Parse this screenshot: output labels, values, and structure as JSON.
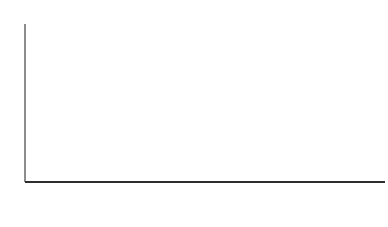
{
  "chart_data": {
    "type": "bar",
    "title": "",
    "subtitle": "",
    "xlabel": "",
    "ylabel": "",
    "ylim": [
      0,
      40
    ],
    "yticks": [
      0,
      10,
      20,
      30,
      40
    ],
    "ytick_labels": [
      "0%",
      "10%",
      "20%",
      "30%",
      "40%"
    ],
    "grid": true,
    "legend_position": "top-right",
    "units": "percent",
    "categories": [
      "<$20K",
      "$20-25K",
      "$26-35K",
      "$36-45K",
      "$46-55K",
      "$56-75K",
      "$76-99K",
      "$100-149K",
      "$150-199K",
      "$200-299K",
      "$300-399K",
      "$400-499K",
      "$500-599K",
      "$600-999K",
      "$1MM-1.5MM",
      "$1.6MM-1.99MM",
      ">$2MM"
    ],
    "series": [
      {
        "name": "Amherst",
        "color": "#6d6d6d",
        "values": [
          5.0,
          5.3,
          3.7,
          6.4,
          5.6,
          8.0,
          12.5,
          15.0,
          15.5,
          23.0,
          13.8,
          14.2,
          4.8,
          2.4,
          1.5,
          2.2,
          0.5
        ]
      },
      {
        "name": "All College Grads",
        "color": "#9e9e9e",
        "values": [
          3.3,
          2.0,
          4.2,
          4.6,
          5.9,
          8.4,
          10.8,
          14.3,
          13.3,
          14.0,
          11.0,
          3.2,
          1.7,
          1.3,
          0.7,
          0.4,
          0.7
        ]
      }
    ]
  },
  "legend": {
    "entries": [
      {
        "label": "Amherst",
        "color": "#6d6d6d"
      },
      {
        "label": "All College Grads",
        "color": "#9e9e9e"
      }
    ]
  },
  "x_axis": {
    "row_top": [
      "<$20K",
      "$26-\n35K",
      "$46-\n55K",
      "$76-\n99K",
      "$150-\n199K",
      "$300-\n399K",
      "$500-\n599K",
      "$1MM-\n1.5MM",
      ">$2MM"
    ],
    "row_bottom": [
      "$20-\n25K",
      "$36-\n45K",
      "$56-\n75K",
      "$100-\n149K",
      "$200-\n299K",
      "$400-\n499K",
      "$600-\n999K",
      "$1.6MM-\n1.99MM"
    ],
    "labels_top": [
      {
        "line1": "<$20K",
        "line2": ""
      },
      {
        "line1": "$26-",
        "line2": "35K"
      },
      {
        "line1": "$46-",
        "line2": "55K"
      },
      {
        "line1": "$76-",
        "line2": "99K"
      },
      {
        "line1": "$150-",
        "line2": "199K"
      },
      {
        "line1": "$300-",
        "line2": "399K"
      },
      {
        "line1": "$500-",
        "line2": "599K"
      },
      {
        "line1": "$1MM-",
        "line2": "1.5MM"
      },
      {
        "line1": ">$2MM",
        "line2": ""
      }
    ],
    "labels_bottom": [
      {
        "line1": "$20-",
        "line2": "25K"
      },
      {
        "line1": "$36-",
        "line2": "45K"
      },
      {
        "line1": "$56-",
        "line2": "75K"
      },
      {
        "line1": "$100-",
        "line2": "149K"
      },
      {
        "line1": "$200-",
        "line2": "299K"
      },
      {
        "line1": "$400-",
        "line2": "499K"
      },
      {
        "line1": "$600-",
        "line2": "999K"
      },
      {
        "line1": "$1.6MM-",
        "line2": "1.99MM"
      }
    ]
  },
  "colors": {
    "series_amherst": "#6d6d6d",
    "series_all_grads": "#9e9e9e",
    "gridline": "#e2e2e2",
    "axis": "#2e2e2e",
    "text": "#3a3a3a",
    "background": "#ffffff"
  }
}
